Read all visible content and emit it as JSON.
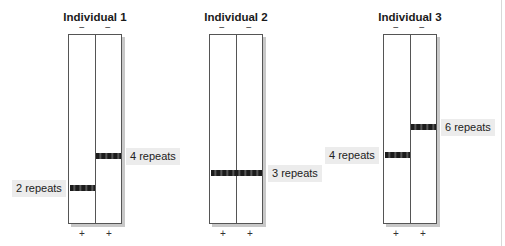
{
  "diagram": {
    "minus_sign": "−",
    "plus_sign": "+",
    "colors": {
      "band": "#1c1c1c",
      "gel_border": "#555555",
      "label_bg": "#ececec",
      "shadow": "#c8c8c8"
    },
    "individuals": [
      {
        "title": "Individual 1",
        "bands": [
          {
            "lane": 1,
            "label": "2 repeats",
            "label_side": "left"
          },
          {
            "lane": 2,
            "label": "4 repeats",
            "label_side": "right"
          }
        ]
      },
      {
        "title": "Individual 2",
        "bands": [
          {
            "lane": "both",
            "label": "3 repeats",
            "label_side": "right"
          }
        ]
      },
      {
        "title": "Individual 3",
        "bands": [
          {
            "lane": 1,
            "label": "4 repeats",
            "label_side": "left"
          },
          {
            "lane": 2,
            "label": "6 repeats",
            "label_side": "right"
          }
        ]
      }
    ]
  }
}
